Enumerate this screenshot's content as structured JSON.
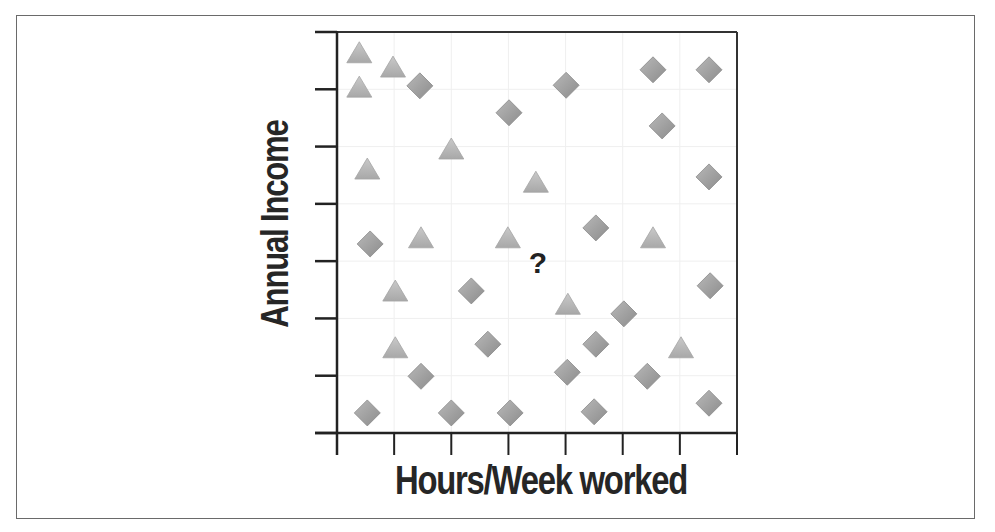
{
  "chart_data": {
    "type": "scatter",
    "title": "",
    "xlabel": "Hours/Week worked",
    "ylabel": "Annual Income",
    "xlim": [
      0,
      7
    ],
    "ylim": [
      0,
      7
    ],
    "xticks": [
      0,
      1,
      2,
      3,
      4,
      5,
      6,
      7
    ],
    "yticks": [
      0,
      1,
      2,
      3,
      4,
      5,
      6,
      7
    ],
    "tick_labels_shown": false,
    "grid": true,
    "legend": null,
    "annotations": [
      {
        "text": "?",
        "x": 3.5,
        "y": 3.0
      }
    ],
    "series": [
      {
        "name": "triangle",
        "marker": "triangle",
        "color": "#b3b3b3",
        "points": [
          [
            0.39,
            6.62
          ],
          [
            0.98,
            6.37
          ],
          [
            0.39,
            6.02
          ],
          [
            2.0,
            4.94
          ],
          [
            0.53,
            4.59
          ],
          [
            3.48,
            4.36
          ],
          [
            1.47,
            3.39
          ],
          [
            2.99,
            3.39
          ],
          [
            5.53,
            3.39
          ],
          [
            1.02,
            2.46
          ],
          [
            4.04,
            2.23
          ],
          [
            1.02,
            1.47
          ],
          [
            6.02,
            1.47
          ]
        ]
      },
      {
        "name": "diamond",
        "marker": "diamond",
        "color": "#9c9c9c",
        "points": [
          [
            1.45,
            6.06
          ],
          [
            3.01,
            5.59
          ],
          [
            4.01,
            6.07
          ],
          [
            5.53,
            6.34
          ],
          [
            6.51,
            6.34
          ],
          [
            5.69,
            5.36
          ],
          [
            6.51,
            4.47
          ],
          [
            0.58,
            3.3
          ],
          [
            4.53,
            3.58
          ],
          [
            2.35,
            2.48
          ],
          [
            6.53,
            2.57
          ],
          [
            5.02,
            2.08
          ],
          [
            2.64,
            1.55
          ],
          [
            4.53,
            1.55
          ],
          [
            1.47,
            0.99
          ],
          [
            4.03,
            1.06
          ],
          [
            5.43,
            0.99
          ],
          [
            0.53,
            0.35
          ],
          [
            2.0,
            0.35
          ],
          [
            3.03,
            0.35
          ],
          [
            4.5,
            0.37
          ],
          [
            6.51,
            0.52
          ]
        ]
      }
    ]
  },
  "labels": {
    "x_axis": "Hours/Week worked",
    "y_axis": "Annual Income",
    "question_mark": "?"
  }
}
